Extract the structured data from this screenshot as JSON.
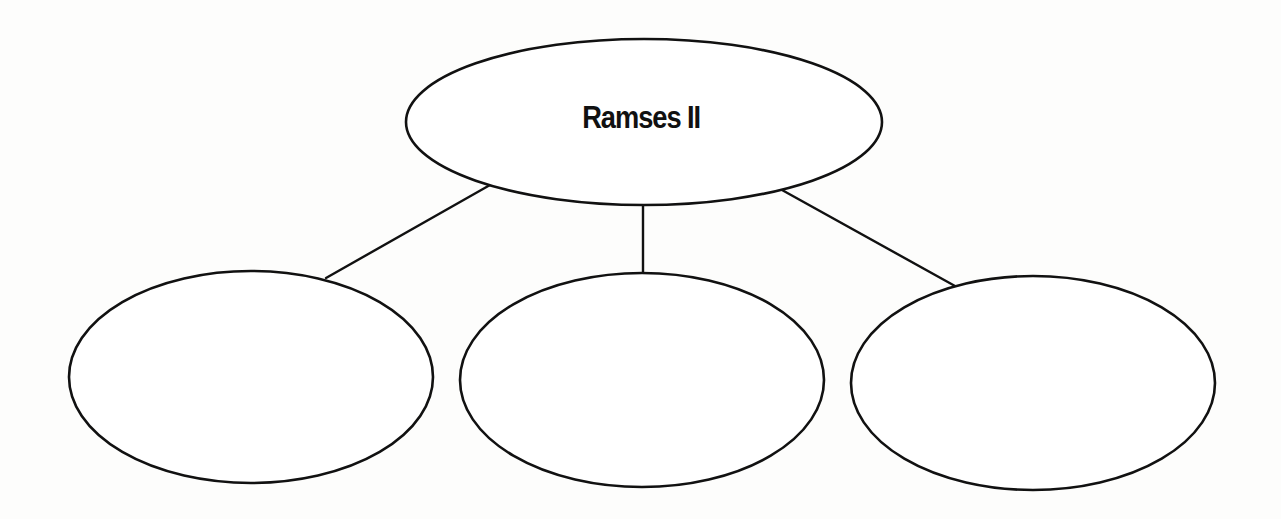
{
  "diagram": {
    "type": "concept-web",
    "center_node": {
      "label": "Ramses II",
      "cx": 644,
      "cy": 122,
      "rx": 238,
      "ry": 83
    },
    "child_nodes": [
      {
        "label": "",
        "cx": 251,
        "cy": 377,
        "rx": 182,
        "ry": 106
      },
      {
        "label": "",
        "cx": 642,
        "cy": 380,
        "rx": 182,
        "ry": 107
      },
      {
        "label": "",
        "cx": 1033,
        "cy": 383,
        "rx": 182,
        "ry": 107
      }
    ],
    "connectors": [
      {
        "from": "center",
        "to": "child-1",
        "x1": 490,
        "y1": 185,
        "x2": 326,
        "y2": 278
      },
      {
        "from": "center",
        "to": "child-2",
        "x1": 643,
        "y1": 205,
        "x2": 643,
        "y2": 273
      },
      {
        "from": "center",
        "to": "child-3",
        "x1": 782,
        "y1": 190,
        "x2": 955,
        "y2": 286
      }
    ],
    "colors": {
      "stroke": "#111111",
      "fill": "#ffffff",
      "background": "#fdfdfc"
    }
  }
}
